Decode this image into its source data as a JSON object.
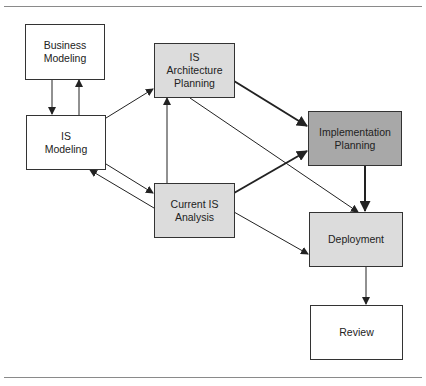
{
  "diagram": {
    "colors": {
      "white": "#ffffff",
      "light_gray": "#dcdcdc",
      "dark_gray": "#a8a8a8",
      "line": "#222222"
    },
    "nodes": [
      {
        "id": "business-modeling",
        "label": "Business\nModeling",
        "fill": "white"
      },
      {
        "id": "is-architecture-planning",
        "label": "IS\nArchitecture\nPlanning",
        "fill": "light"
      },
      {
        "id": "is-modeling",
        "label": "IS\nModeling",
        "fill": "white"
      },
      {
        "id": "implementation-planning",
        "label": "Implementation\nPlanning",
        "fill": "dark"
      },
      {
        "id": "current-is-analysis",
        "label": "Current IS\nAnalysis",
        "fill": "light"
      },
      {
        "id": "deployment",
        "label": "Deployment",
        "fill": "light"
      },
      {
        "id": "review",
        "label": "Review",
        "fill": "white"
      }
    ],
    "edges": [
      {
        "from": "business-modeling",
        "to": "is-modeling",
        "weight": "thin"
      },
      {
        "from": "is-modeling",
        "to": "business-modeling",
        "weight": "thin"
      },
      {
        "from": "is-modeling",
        "to": "is-architecture-planning",
        "weight": "thin"
      },
      {
        "from": "is-modeling",
        "to": "current-is-analysis",
        "weight": "thin"
      },
      {
        "from": "current-is-analysis",
        "to": "is-modeling",
        "weight": "thin"
      },
      {
        "from": "current-is-analysis",
        "to": "is-architecture-planning",
        "weight": "thin"
      },
      {
        "from": "is-architecture-planning",
        "to": "implementation-planning",
        "weight": "thick"
      },
      {
        "from": "current-is-analysis",
        "to": "implementation-planning",
        "weight": "thick"
      },
      {
        "from": "is-architecture-planning",
        "to": "deployment",
        "weight": "thin"
      },
      {
        "from": "current-is-analysis",
        "to": "deployment",
        "weight": "thin"
      },
      {
        "from": "implementation-planning",
        "to": "deployment",
        "weight": "thick"
      },
      {
        "from": "deployment",
        "to": "review",
        "weight": "thin"
      }
    ]
  }
}
